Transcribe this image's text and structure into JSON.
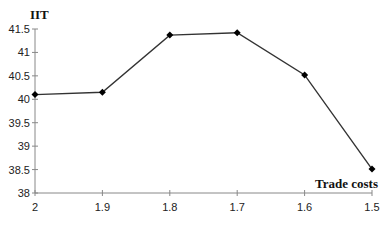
{
  "chart_data": {
    "type": "line",
    "title": "",
    "xlabel": "Trade costs",
    "ylabel": "IIT",
    "categories": [
      "2",
      "1.9",
      "1.8",
      "1.7",
      "1.6",
      "1.5"
    ],
    "x": [
      2,
      1.9,
      1.8,
      1.7,
      1.6,
      1.5
    ],
    "series": [
      {
        "name": "IIT",
        "values": [
          40.1,
          40.15,
          41.37,
          41.42,
          40.52,
          38.51
        ]
      }
    ],
    "ylim": [
      38,
      41.5
    ],
    "yticks": [
      "38",
      "38.5",
      "39",
      "39.5",
      "40",
      "40.5",
      "41",
      "41.5"
    ],
    "grid": false,
    "legend": "none",
    "marker": "diamond",
    "line_color": "#333333"
  }
}
